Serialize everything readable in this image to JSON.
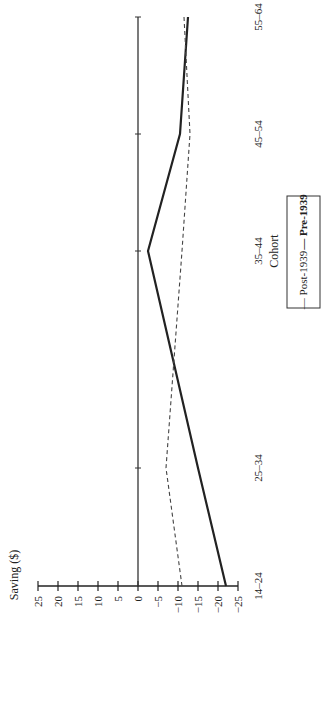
{
  "chart_data": {
    "type": "line",
    "orientation": "rotated-90-ccw",
    "title": "",
    "xlabel": "Cohort",
    "ylabel": "Saving ($)",
    "categories": [
      "14–24",
      "25–34",
      "35–44",
      "45–54",
      "55–64"
    ],
    "yticks": [
      25,
      20,
      15,
      10,
      5,
      0,
      -5,
      -10,
      -15,
      -20,
      -25
    ],
    "ytick_labels": [
      "25",
      "20",
      "15",
      "10",
      "5",
      "0",
      "−5",
      "−10",
      "−15",
      "−20",
      "−25"
    ],
    "ylim": [
      -25,
      25
    ],
    "grid": false,
    "zero_line": true,
    "series": [
      {
        "name": "Post-1939",
        "style": "solid",
        "color": "#222222",
        "values": [
          -22,
          -15,
          -2.5,
          -10.5,
          -12.5
        ]
      },
      {
        "name": "Pre-1939",
        "style": "dashed",
        "color": "#444444",
        "values": [
          -11,
          -7,
          -11,
          -13,
          -11.5
        ]
      }
    ],
    "legend": {
      "position": "bottom-right (rotated)",
      "entries": [
        "— Post-1939",
        "— Pre-1939"
      ]
    }
  }
}
